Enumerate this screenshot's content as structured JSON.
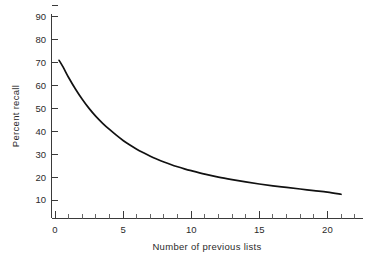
{
  "chart_data": {
    "type": "line",
    "title": "",
    "subtitle": "",
    "xlabel": "Number of previous lists",
    "ylabel": "Percent recall",
    "xlim": [
      -0.6,
      22.5
    ],
    "ylim": [
      0,
      97
    ],
    "grid": false,
    "legend": null,
    "legend_position": "none",
    "x_ticks_major": [
      0,
      5,
      10,
      15,
      20
    ],
    "x_tick_labels": [
      "0",
      "5",
      "10",
      "15",
      "20"
    ],
    "x_minor_tick_interval": 1,
    "y_ticks_major": [
      10,
      20,
      30,
      40,
      50,
      60,
      70,
      80,
      90
    ],
    "y_tick_labels": [
      "10",
      "20",
      "30",
      "40",
      "50",
      "60",
      "70",
      "80",
      "90"
    ],
    "y_minor_tick_interval": 10,
    "series": [
      {
        "name": "Percent recall",
        "color": "#111111",
        "x": [
          0.3,
          0.6,
          1.0,
          1.5,
          2.0,
          2.5,
          3.0,
          3.5,
          4.0,
          4.5,
          5.0,
          5.5,
          6.0,
          6.5,
          7.0,
          7.5,
          8.0,
          8.5,
          9.0,
          9.5,
          10.0,
          11.0,
          12.0,
          13.0,
          14.0,
          15.0,
          16.0,
          17.0,
          18.0,
          19.0,
          20.0,
          21.0
        ],
        "y": [
          71.0,
          68.0,
          63.5,
          58.5,
          54.0,
          50.0,
          46.5,
          43.5,
          40.8,
          38.3,
          36.0,
          34.0,
          32.2,
          30.6,
          29.1,
          27.8,
          26.6,
          25.5,
          24.5,
          23.6,
          22.8,
          21.3,
          20.0,
          18.9,
          17.9,
          17.0,
          16.2,
          15.5,
          14.8,
          14.1,
          13.4,
          12.5
        ]
      }
    ]
  },
  "axes": {
    "x_axis_name": "x-axis",
    "y_axis_name": "y-axis"
  },
  "colors": {
    "background": "#ffffff",
    "axis": "#3a3a3a",
    "curve": "#111111",
    "text": "#2b2b2b"
  }
}
